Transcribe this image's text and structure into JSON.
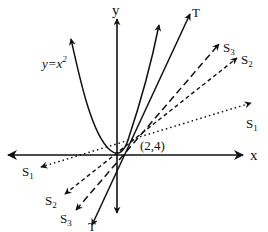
{
  "diagram": {
    "type": "secant lines approaching tangent line",
    "curve": {
      "label": "y=x",
      "exponent": "2",
      "equation": "y=x^2"
    },
    "point": {
      "label": "(2,4)",
      "x": 2,
      "y": 4
    },
    "axes": {
      "x_label": "x",
      "y_label": "y"
    },
    "lines": [
      {
        "id": "T",
        "label": "T",
        "subscript": "",
        "style": "solid",
        "role": "tangent line"
      },
      {
        "id": "S3",
        "label": "S",
        "subscript": "3",
        "style": "long-dashed",
        "role": "secant line"
      },
      {
        "id": "S2",
        "label": "S",
        "subscript": "2",
        "style": "short-dashed",
        "role": "secant line"
      },
      {
        "id": "S1",
        "label": "S",
        "subscript": "1",
        "style": "dotted",
        "role": "secant line"
      }
    ]
  }
}
